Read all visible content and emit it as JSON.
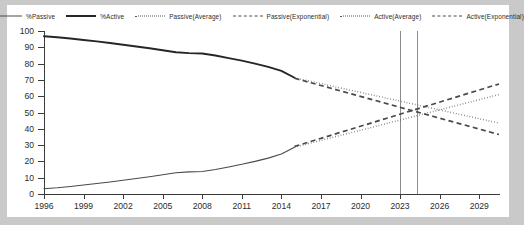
{
  "chart": {
    "type": "line",
    "title": "",
    "background_color": "#c9c9c9",
    "plot_background_color": "#ffffff",
    "axis_color": "#3b3b3b",
    "marker_line_color": "#8c8c8c"
  },
  "legend": {
    "position": "top-center",
    "items": [
      {
        "label": "%Passive",
        "style": "solid-thin",
        "color": "#4a4a4a",
        "swatch": "line-solid-thin-swatch"
      },
      {
        "label": "%Active",
        "style": "solid-thick",
        "color": "#262626",
        "swatch": "line-solid-thick-swatch"
      },
      {
        "label": "Passive(Average)",
        "style": "dotted",
        "color": "#555555",
        "swatch": "line-dotted-swatch"
      },
      {
        "label": "Passive(Exponential)",
        "style": "dashed",
        "color": "#4a4a4a",
        "swatch": "line-dashed-swatch"
      },
      {
        "label": "Active(Average)",
        "style": "dotted",
        "color": "#555555",
        "swatch": "line-dotted-swatch"
      },
      {
        "label": "Active(Exponential)",
        "style": "dashed",
        "color": "#4a4a4a",
        "swatch": "line-dashed-swatch"
      }
    ]
  },
  "chart_data": {
    "type": "line",
    "title": "",
    "xlabel": "",
    "ylabel": "",
    "xlim": [
      1996,
      2030.5
    ],
    "ylim": [
      0,
      100
    ],
    "grid": false,
    "legend_position": "top-center",
    "y_ticks": [
      0,
      10,
      20,
      30,
      40,
      50,
      60,
      70,
      80,
      90,
      100
    ],
    "x_ticks": [
      1996,
      1999,
      2002,
      2005,
      2008,
      2011,
      2014,
      2017,
      2020,
      2023,
      2026,
      2029
    ],
    "x_tick_labels": [
      "1996",
      "1999",
      "2002",
      "2005",
      "2008",
      "2011",
      "2014",
      "2017",
      "2020",
      "2023",
      "2026",
      "2029"
    ],
    "annotations": [
      {
        "name": "crossover-marker-1",
        "type": "vertical-line",
        "x": 2023.0
      },
      {
        "name": "crossover-marker-2",
        "type": "vertical-line",
        "x": 2024.3
      }
    ],
    "series": [
      {
        "name": "%Active",
        "style": "solid-thick",
        "color": "#262626",
        "x": [
          1996,
          1997,
          1998,
          1999,
          2000,
          2001,
          2002,
          2003,
          2004,
          2005,
          2006,
          2007,
          2008,
          2009,
          2010,
          2011,
          2012,
          2013,
          2014,
          2015
        ],
        "values": [
          96.8,
          96.2,
          95.4,
          94.5,
          93.6,
          92.6,
          91.6,
          90.5,
          89.4,
          88.2,
          87.0,
          86.4,
          86.2,
          85.0,
          83.4,
          81.8,
          80.0,
          78.0,
          75.5,
          71.3
        ]
      },
      {
        "name": "%Passive",
        "style": "solid-thin",
        "color": "#4a4a4a",
        "x": [
          1996,
          1997,
          1998,
          1999,
          2000,
          2001,
          2002,
          2003,
          2004,
          2005,
          2006,
          2007,
          2008,
          2009,
          2010,
          2011,
          2012,
          2013,
          2014,
          2015
        ],
        "values": [
          3.2,
          3.8,
          4.6,
          5.5,
          6.4,
          7.4,
          8.4,
          9.5,
          10.6,
          11.8,
          13.0,
          13.6,
          13.8,
          15.0,
          16.6,
          18.2,
          20.0,
          22.0,
          24.5,
          28.7
        ]
      },
      {
        "name": "Active(Average)",
        "style": "dotted",
        "color": "#555555",
        "x": [
          2015,
          2030.5
        ],
        "values": [
          71.3,
          43.5
        ]
      },
      {
        "name": "Active(Exponential)",
        "style": "dashed",
        "color": "#4a4a4a",
        "x": [
          2015,
          2030.5
        ],
        "values": [
          71.0,
          36.5
        ]
      },
      {
        "name": "Passive(Average)",
        "style": "dotted",
        "color": "#555555",
        "x": [
          2015,
          2030.5
        ],
        "values": [
          28.7,
          61.0
        ]
      },
      {
        "name": "Passive(Exponential)",
        "style": "dashed",
        "color": "#4a4a4a",
        "x": [
          2015,
          2030.5
        ],
        "values": [
          29.2,
          67.5
        ]
      }
    ]
  }
}
